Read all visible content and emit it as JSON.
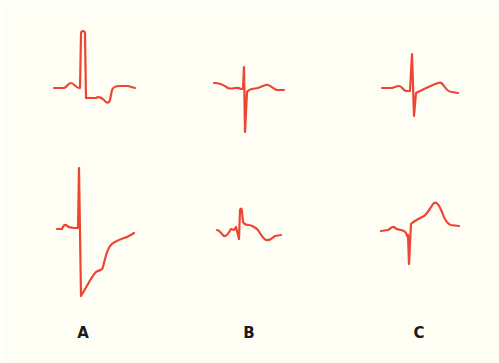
{
  "figure": {
    "background": "#fffef4",
    "trace_color": "#ee4433",
    "trace_width": 2.2,
    "columns": [
      {
        "label": "A",
        "x": 83
      },
      {
        "label": "B",
        "x": 249
      },
      {
        "label": "C",
        "x": 419
      }
    ],
    "waveforms": [
      {
        "id": "A-top",
        "column": "A",
        "row": 1,
        "path": "M54,88 L64,88 C67,87 68,83 71,83 C74,83 76,88 79,88 L80,88 L81,34 C81,30 85,30 85,34 L86,98 L96,98 C99,96 101,97 104,100 C106,103 109,104 110,100 L112,90 C113,87 116,86 120,86 L128,86 L135,88"
      },
      {
        "id": "B-top",
        "column": "B",
        "row": 1,
        "path": "M214,83 C220,83 224,85 228,88 C232,90 236,86 241,89 L243,89 L244,67 L245,132 L247,92 C250,88 254,89 258,88 C262,87 265,84 268,85 C272,86 274,90 278,90 L284,90"
      },
      {
        "id": "C-top",
        "column": "C",
        "row": 1,
        "path": "M382,88 L392,88 C395,87 397,86 399,86 C402,86 403,90 406,91 L410,91 L412,54 L414,116 L416,93 L418,92 C424,89 432,85 438,83 C441,82 442,83 444,86 C446,89 449,92 452,92 L458,93"
      },
      {
        "id": "A-bottom",
        "column": "A",
        "row": 2,
        "path": "M57,229 L62,229 C63,227 64,224 66,225 C68,227 70,228 74,228 L78,228 L79,168 L81,296 L84,291 C88,284 92,276 96,272 C99,270 102,271 103,267 C105,260 106,252 110,246 C113,242 118,240 124,238 C128,237 131,235 134,233"
      },
      {
        "id": "B-bottom",
        "column": "B",
        "row": 2,
        "path": "M217,230 C220,230 221,234 224,236 C227,237 229,232 231,229 L234,230 L236,227 L239,239 L240,210 C241,208 242,208 242,212 L243,222 C244,224 246,225 249,225 C252,225 254,227 257,229 C260,232 262,238 266,240 C270,241 272,238 275,236 L281,235"
      },
      {
        "id": "C-bottom",
        "column": "C",
        "row": 2,
        "path": "M381,231 L388,230 C390,229 392,226 394,227 C396,229 398,230 401,230 L404,231 L406,233 L407,236 L408,235 L409,264 L411,224 C413,222 418,219 424,216 C428,213 431,206 434,203 C437,201 440,207 442,212 C444,218 447,224 451,225 L459,226"
      }
    ]
  }
}
